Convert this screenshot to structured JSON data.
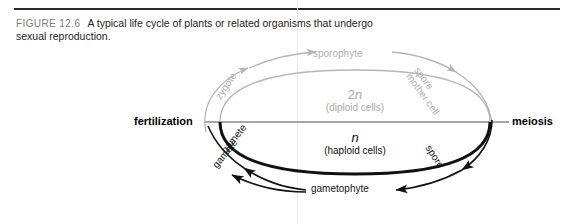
{
  "caption": {
    "figure_label": "FIGURE 12.6",
    "text": "A typical life cycle of plants or related organisms that undergo sexual reproduction."
  },
  "diagram": {
    "left_process": "fertilization",
    "right_process": "meiosis",
    "diploid": {
      "symbol_number": "2",
      "symbol_letter": "n",
      "description": "(diploid cells)"
    },
    "haploid": {
      "symbol_letter": "n",
      "description": "(haploid cells)"
    },
    "stages": {
      "sporophyte": "sporophyte",
      "zygote": "zygote",
      "spore_mother_cell_line1": "spore",
      "spore_mother_cell_line2": "mother cell",
      "gamete_1": "gamete",
      "gamete_2": "gamete",
      "spore": "spore",
      "gametophyte": "gametophyte"
    },
    "colors": {
      "diploid_grey": "#b0b0b0",
      "haploid_black": "#151515",
      "axis_grey": "#8a8a8a",
      "rule_black": "#2b2b2b"
    }
  }
}
